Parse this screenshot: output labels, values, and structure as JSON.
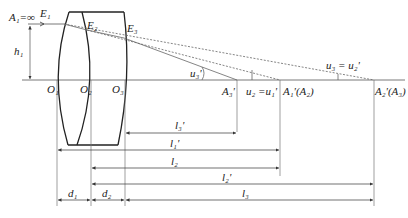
{
  "diagram": {
    "points": {
      "A1": "A₁=∞",
      "E1": "E₁",
      "E2": "E₂",
      "E3": "E₃",
      "h1": "h₁",
      "O1": "O₁",
      "O2": "O₂",
      "O3": "O₃",
      "A3p": "A₃'",
      "A1pA2": "A₁'(A₂)",
      "A2pA3": "A₂'(A₃)"
    },
    "angles": {
      "u3p": "u₃'",
      "u2": "u₂ =u₁'",
      "u3": "u₃ = u₂'"
    },
    "dimensions": {
      "l3p": "l₃'",
      "l1p": "l₁'",
      "l2": "l₂",
      "l2p": "l₂'",
      "d1": "d₁",
      "d2": "d₂",
      "l3": "l₃"
    }
  }
}
